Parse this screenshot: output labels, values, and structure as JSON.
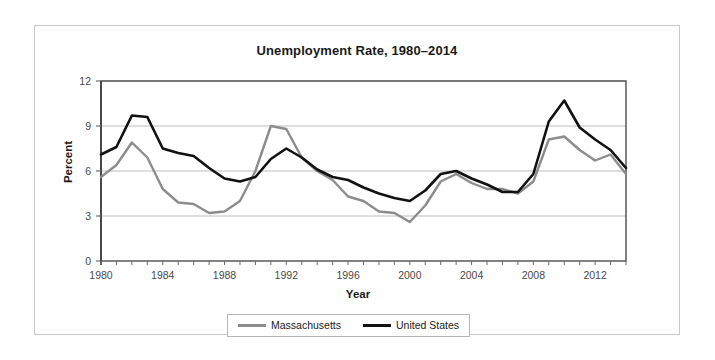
{
  "chart_data": {
    "type": "line",
    "title": "Unemployment Rate, 1980–2014",
    "xlabel": "Year",
    "ylabel": "Percent",
    "xlim": [
      1980,
      2014
    ],
    "ylim": [
      0,
      12
    ],
    "yticks": [
      0,
      3,
      6,
      9,
      12
    ],
    "xticks": [
      1980,
      1984,
      1988,
      1992,
      1996,
      2000,
      2004,
      2008,
      2012
    ],
    "xticks_minor_step": 1,
    "grid": "horizontal",
    "legend_position": "bottom-center",
    "x": [
      1980,
      1981,
      1982,
      1983,
      1984,
      1985,
      1986,
      1987,
      1988,
      1989,
      1990,
      1991,
      1992,
      1993,
      1994,
      1995,
      1996,
      1997,
      1998,
      1999,
      2000,
      2001,
      2002,
      2003,
      2004,
      2005,
      2006,
      2007,
      2008,
      2009,
      2010,
      2011,
      2012,
      2013,
      2014
    ],
    "series": [
      {
        "name": "Massachusetts",
        "color": "#8c8c8c",
        "values": [
          5.6,
          6.4,
          7.9,
          6.9,
          4.8,
          3.9,
          3.8,
          3.2,
          3.3,
          4.0,
          6.0,
          9.0,
          8.8,
          6.9,
          6.0,
          5.4,
          4.3,
          4.0,
          3.3,
          3.2,
          2.6,
          3.7,
          5.3,
          5.8,
          5.2,
          4.8,
          4.8,
          4.5,
          5.3,
          8.1,
          8.3,
          7.4,
          6.7,
          7.1,
          5.8
        ]
      },
      {
        "name": "United States",
        "color": "#111111",
        "values": [
          7.1,
          7.6,
          9.7,
          9.6,
          7.5,
          7.2,
          7.0,
          6.2,
          5.5,
          5.3,
          5.6,
          6.8,
          7.5,
          6.9,
          6.1,
          5.6,
          5.4,
          4.9,
          4.5,
          4.2,
          4.0,
          4.7,
          5.8,
          6.0,
          5.5,
          5.1,
          4.6,
          4.6,
          5.8,
          9.3,
          10.7,
          8.9,
          8.1,
          7.4,
          6.2
        ]
      }
    ]
  }
}
